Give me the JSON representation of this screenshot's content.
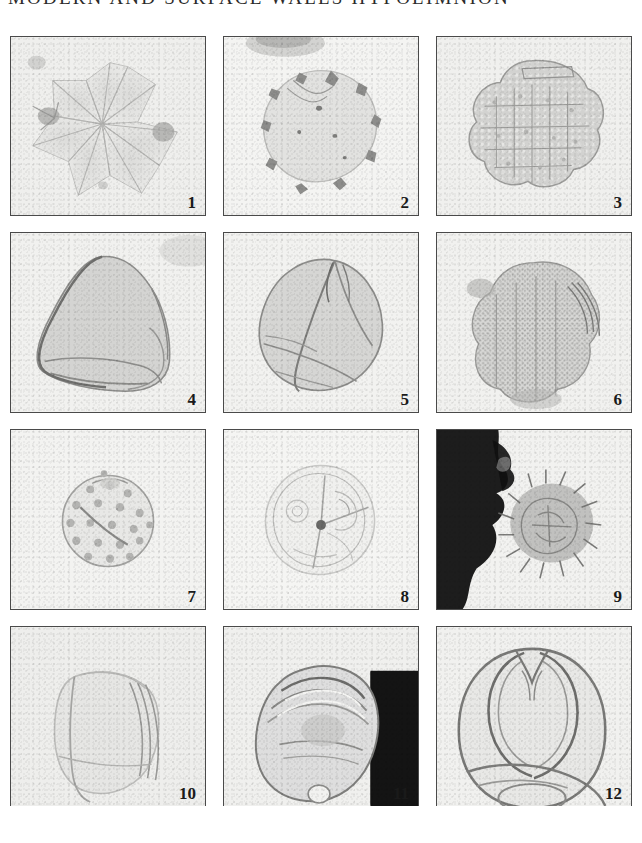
{
  "plate": {
    "title": "MODERN AND SURFACE WALLS HYPOLIMNION",
    "columns": 3,
    "rows": 4,
    "background_color": "#ffffff",
    "panel_fill": "#f2f2f0",
    "panel_border_color": "#4a4a4a",
    "number_color": "#1a1a1a",
    "figures": [
      {
        "number": "1",
        "caption": "multi-lobed polyplicate pollen grain, pale rosette of overlapping angular lobes",
        "tone": "very pale gray",
        "row": 1,
        "column": 1
      },
      {
        "number": "2",
        "caption": "rounded grain with dark notched margin indentations and faint interior specks",
        "tone": "pale gray with dark marginal notches",
        "row": 1,
        "column": 2
      },
      {
        "number": "3",
        "caption": "subcircular reticulate grain with coarse granular surface sculpture",
        "tone": "medium gray, granular",
        "row": 1,
        "column": 3
      },
      {
        "number": "4",
        "caption": "large triangular grain, smooth thick wall, dark outline on upper left",
        "tone": "medium gray",
        "row": 2,
        "column": 1
      },
      {
        "number": "5",
        "caption": "trilobate grain in polar view showing three colpi converging at apex",
        "tone": "medium gray",
        "row": 2,
        "column": 2
      },
      {
        "number": "6",
        "caption": "echinate grain with dense granular sculpture and lobed outline",
        "tone": "medium gray, heavily granular",
        "row": 2,
        "column": 3
      },
      {
        "number": "7",
        "caption": "small spherical grain with strongly pitted reticulate surface",
        "tone": "light gray, pitted",
        "row": 3,
        "column": 1
      },
      {
        "number": "8",
        "caption": "faint thin-walled grain with lines radiating from a dark central point",
        "tone": "very pale gray outline",
        "row": 3,
        "column": 2
      },
      {
        "number": "9",
        "caption": "spiny grain beside a large opaque black debris mass at left",
        "tone": "pale grain against black debris",
        "row": 3,
        "column": 3
      },
      {
        "number": "10",
        "caption": "faint angular grain with parallel folds at right, very low contrast",
        "tone": "very pale gray",
        "row": 4,
        "column": 1
      },
      {
        "number": "11",
        "caption": "bisaccate grain with folded cappa, dark opaque block at right edge",
        "tone": "medium gray with black block",
        "row": 4,
        "column": 2
      },
      {
        "number": "12",
        "caption": "bisaccate grain showing two prominent sacci and thick outlined corpus",
        "tone": "medium gray outlined",
        "row": 4,
        "column": 3
      }
    ]
  }
}
